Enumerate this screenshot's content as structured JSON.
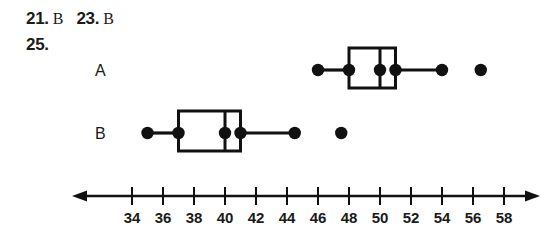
{
  "answer_key": {
    "entries": [
      {
        "number": "21.",
        "answer": "B"
      },
      {
        "number": "23.",
        "answer": "B"
      },
      {
        "number": "25.",
        "answer": ""
      }
    ]
  },
  "chart_data": {
    "type": "boxplot",
    "title": "",
    "xlabel": "",
    "ylabel": "",
    "orientation": "horizontal",
    "grid": false,
    "legend": "none",
    "xlim": [
      32.5,
      59.5
    ],
    "xticks": [
      34,
      36,
      38,
      40,
      42,
      44,
      46,
      48,
      50,
      52,
      54,
      56,
      58
    ],
    "xtick_labels": [
      "34",
      "36",
      "38",
      "40",
      "42",
      "44",
      "46",
      "48",
      "50",
      "52",
      "54",
      "56",
      "58"
    ],
    "axis_arrows": "both",
    "series": [
      {
        "name": "A",
        "label": "A",
        "min": 46.0,
        "q1": 48.0,
        "median": 50.0,
        "q3": 51.0,
        "max": 54.0,
        "outliers": [
          56.5
        ],
        "marker_points": [
          46.0,
          48.0,
          50.0,
          51.0,
          54.0,
          56.5
        ]
      },
      {
        "name": "B",
        "label": "B",
        "min": 35.0,
        "q1": 37.0,
        "median": 40.0,
        "q3": 41.0,
        "max": 44.5,
        "outliers": [
          47.5
        ],
        "marker_points": [
          35.0,
          37.0,
          40.0,
          41.0,
          44.5,
          47.5
        ]
      }
    ]
  },
  "colors": {
    "ink": "#111111",
    "background": "#ffffff"
  }
}
